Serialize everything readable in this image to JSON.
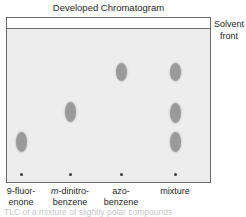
{
  "title": "Developed Chromatogram",
  "annotations": {
    "solvent_front_line1": "Solvent",
    "solvent_front_line2": "front"
  },
  "plate": {
    "fill_color": "#ededed",
    "border_color": "#6b6b6b",
    "solvent_band_color": "#ffffff",
    "spot_color": "#9a9a9a",
    "origin_dot_color": "#3d3d3d"
  },
  "lanes": [
    {
      "id": "lane-9-fluorenone",
      "label_line1": "9-fluor-",
      "label_line2": "enone",
      "label_italic_prefix": "",
      "origin_dot": {
        "x": 21,
        "y": 174
      },
      "spots": [
        {
          "x": 21,
          "y": 142,
          "rx": 5.5,
          "ry": 10
        }
      ]
    },
    {
      "id": "lane-m-dinitrobenzene",
      "label_line1": "-dinitro-",
      "label_line2": "benzene",
      "label_italic_prefix": "m",
      "origin_dot": {
        "x": 70,
        "y": 174
      },
      "spots": [
        {
          "x": 70,
          "y": 112,
          "rx": 5.5,
          "ry": 10
        }
      ]
    },
    {
      "id": "lane-azobenzene",
      "label_line1": "azo-",
      "label_line2": "benzene",
      "label_italic_prefix": "",
      "origin_dot": {
        "x": 121,
        "y": 174
      },
      "spots": [
        {
          "x": 121,
          "y": 72,
          "rx": 5.5,
          "ry": 9
        }
      ]
    },
    {
      "id": "lane-mixture",
      "label_line1": "mixture",
      "label_line2": "",
      "label_italic_prefix": "",
      "origin_dot": {
        "x": 175,
        "y": 174
      },
      "spots": [
        {
          "x": 175,
          "y": 72,
          "rx": 5.5,
          "ry": 9
        },
        {
          "x": 175,
          "y": 113,
          "rx": 5.5,
          "ry": 10
        },
        {
          "x": 175,
          "y": 142,
          "rx": 5.5,
          "ry": 10
        }
      ]
    }
  ],
  "caption_partial": "TLC of a mixture of slightly polar compounds"
}
